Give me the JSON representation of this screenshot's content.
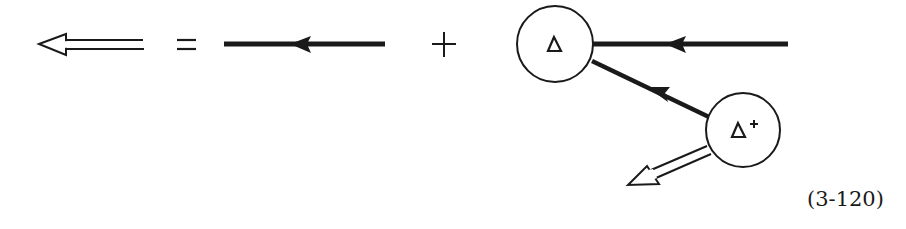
{
  "diagram": {
    "type": "feynman-diagram-equation",
    "colors": {
      "ink": "#1a1a1a",
      "background": "#ffffff"
    },
    "lhs": {
      "symbol": "double-line-arrow",
      "direction": "left",
      "meaning": "dressed propagator"
    },
    "operators": {
      "equals": "=",
      "plus": "+"
    },
    "term1": {
      "symbol": "thick-line-arrow",
      "direction": "left",
      "meaning": "bare propagator"
    },
    "term2": {
      "vertex1": {
        "label": "Δ"
      },
      "vertex2": {
        "label": "Δ",
        "superscript": "+"
      },
      "lines": [
        {
          "from": "right",
          "to": "vertex1",
          "style": "thick",
          "arrow": "left"
        },
        {
          "from": "vertex2",
          "to": "vertex1",
          "style": "thick",
          "arrow": "toward-vertex1"
        },
        {
          "from": "vertex2",
          "to": "lower-left",
          "style": "double",
          "arrow": "outward"
        }
      ]
    },
    "equation_number": "(3-120)"
  }
}
